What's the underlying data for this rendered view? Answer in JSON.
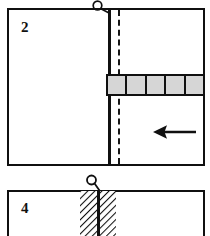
{
  "figure": {
    "background_color": "#ffffff",
    "line_color": "#101010",
    "fill_gray": "#d6d6d6",
    "width": 210,
    "height": 236
  },
  "panels": [
    {
      "id": "panel-2",
      "number_label": "2",
      "frame": {
        "x": 7,
        "y": 8,
        "width": 198,
        "height": 158
      },
      "callout": {
        "name": "Q",
        "label": "Q",
        "circle_center_x": 97,
        "circle_center_y": 5,
        "radius": 4.5,
        "leader_to_x": 110,
        "leader_to_y": 9
      },
      "solid_divider": {
        "name": "vertical-solid-divider",
        "x": 108,
        "y_top": 8,
        "y_bottom": 166,
        "thickness": 2.5
      },
      "dashed_line": {
        "name": "vertical-dashed-line",
        "x": 118,
        "y_top": 10,
        "y_bottom": 164,
        "thickness": 2,
        "style": "dashed"
      },
      "segmented_bar": {
        "name": "segmented-gray-bar",
        "x": 106,
        "y": 74,
        "width": 99,
        "height": 22,
        "segments": 5,
        "fill": "#d6d6d6",
        "stroke": "#101010"
      },
      "arrow": {
        "name": "left-arrow",
        "direction": "left",
        "x": 152,
        "y": 122,
        "width": 44,
        "height": 18
      }
    },
    {
      "id": "panel-4",
      "number_label": "4",
      "frame": {
        "x": 7,
        "y": 190,
        "width": 198,
        "height": 60
      },
      "callout": {
        "name": "Q",
        "label": "Q",
        "circle_center_x": 91,
        "circle_center_y": 180,
        "radius": 4.5,
        "leader_to_x": 99,
        "leader_to_y": 191
      },
      "hatched_band": {
        "name": "hatched-band",
        "x": 80,
        "y": 190,
        "width": 36,
        "height": 46,
        "pattern": "diagonal-hatch",
        "angle_deg": 45
      },
      "solid_divider": {
        "name": "vertical-solid-divider",
        "x": 98,
        "y_top": 190,
        "y_bottom": 236,
        "thickness": 2.5
      }
    }
  ]
}
